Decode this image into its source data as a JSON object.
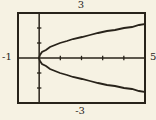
{
  "figure": {
    "background_color": "#f6f2e3",
    "ink_color": "#28231a"
  },
  "chart_data": {
    "type": "line",
    "title": "",
    "xlabel": "",
    "ylabel": "",
    "xlim": [
      -1,
      5
    ],
    "ylim": [
      -3,
      3
    ],
    "xtick_positions": [
      1,
      2,
      3,
      4
    ],
    "ytick_positions": [
      -2,
      -1,
      1,
      2
    ],
    "grid": false,
    "legend": false,
    "window_labels": {
      "top": "3",
      "bottom": "-3",
      "left": "-1",
      "right": "5"
    },
    "series": [
      {
        "name": "upper branch y = sqrt(x)",
        "x": [
          0,
          0.05,
          0.15,
          0.3,
          0.5,
          0.75,
          1,
          1.3,
          1.6,
          2,
          2.4,
          2.8,
          3.2,
          3.6,
          4,
          4.4,
          4.7,
          5
        ],
        "y": [
          0,
          0.224,
          0.387,
          0.548,
          0.707,
          0.866,
          1,
          1.14,
          1.265,
          1.414,
          1.549,
          1.673,
          1.789,
          1.897,
          2,
          2.098,
          2.168,
          2.236
        ]
      },
      {
        "name": "lower branch y = -sqrt(x)",
        "x": [
          0,
          0.05,
          0.15,
          0.3,
          0.5,
          0.75,
          1,
          1.3,
          1.6,
          2,
          2.4,
          2.8,
          3.2,
          3.6,
          4,
          4.4,
          4.7,
          5
        ],
        "y": [
          0,
          -0.224,
          -0.387,
          -0.548,
          -0.707,
          -0.866,
          -1,
          -1.14,
          -1.265,
          -1.414,
          -1.549,
          -1.673,
          -1.789,
          -1.897,
          -2,
          -2.098,
          -2.168,
          -2.236
        ]
      }
    ]
  }
}
